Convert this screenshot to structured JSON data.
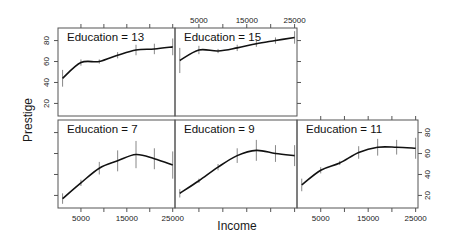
{
  "chart_data": {
    "type": "line",
    "title": "",
    "xlabel": "Income",
    "ylabel": "Prestige",
    "xlim": [
      0,
      25500
    ],
    "ylim": [
      8,
      92
    ],
    "x_ticks": [
      5000,
      10000,
      15000,
      20000,
      25000
    ],
    "x_tick_labels": [
      "5000",
      "15000",
      "25000"
    ],
    "y_ticks": [
      20,
      40,
      60,
      80
    ],
    "y_tick_labels": [
      "20",
      "40",
      "60",
      "80"
    ],
    "grid": false,
    "legend": null,
    "layout": "trellis 3x2 (bottom row: 7, 9, 11; top row: 13, 15)",
    "x": [
      1000,
      5000,
      9000,
      13000,
      17000,
      21000,
      25000
    ],
    "panels": [
      {
        "label": "Education = 7",
        "row": 1,
        "col": 0,
        "values": [
          17,
          32,
          46,
          53,
          59,
          55,
          49
        ],
        "err": [
          5,
          3,
          6,
          10,
          13,
          10,
          13
        ]
      },
      {
        "label": "Education = 9",
        "row": 1,
        "col": 1,
        "values": [
          22,
          34,
          47,
          58,
          63,
          60,
          58
        ],
        "err": [
          4,
          2,
          3,
          7,
          10,
          8,
          10
        ]
      },
      {
        "label": "Education = 11",
        "row": 1,
        "col": 2,
        "values": [
          30,
          44,
          51,
          61,
          66,
          66,
          65
        ],
        "err": [
          6,
          3,
          2,
          6,
          8,
          7,
          10
        ]
      },
      {
        "label": "Education = 13",
        "row": 0,
        "col": 0,
        "values": [
          44,
          59,
          60,
          66,
          71,
          72,
          74
        ],
        "err": [
          8,
          3,
          2,
          3,
          5,
          5,
          8
        ]
      },
      {
        "label": "Education = 15",
        "row": 0,
        "col": 1,
        "values": [
          61,
          71,
          70,
          73,
          77,
          80,
          83
        ],
        "err": [
          12,
          4,
          2,
          3,
          3,
          3,
          6
        ]
      }
    ]
  },
  "axes": {
    "xlabel": "Income",
    "ylabel": "Prestige"
  }
}
